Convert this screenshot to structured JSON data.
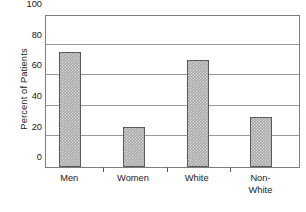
{
  "chart_data": {
    "type": "bar",
    "title": "",
    "xlabel": "",
    "ylabel": "Percent of Patients",
    "categories": [
      "Men",
      "Women",
      "White",
      "Non-White"
    ],
    "values": [
      75,
      26,
      70,
      33
    ],
    "series": [
      {
        "name": "Percent of Patients",
        "values": [
          75,
          26,
          70,
          33
        ]
      }
    ],
    "ylim": [
      0,
      100
    ],
    "y_ticks": [
      0,
      20,
      40,
      60,
      80,
      100
    ],
    "y_tick_labels": [
      "0",
      "20",
      "40",
      "60",
      "80",
      "100"
    ],
    "grid": "horizontal",
    "legend": "none",
    "annotations": [],
    "bar_fill_color": "#a6a6a6",
    "bar_edge_color": "#5a5a5a",
    "gridline_color": "#9a9a9a",
    "frame_color": "#7d7d7d",
    "background_color": "#ffffff",
    "text_color": "#1a1a1a"
  },
  "axes": {
    "y_title": "Percent of Patients",
    "x_category_labels": [
      "Men",
      "Women",
      "White",
      "Non-\nWhite"
    ]
  }
}
